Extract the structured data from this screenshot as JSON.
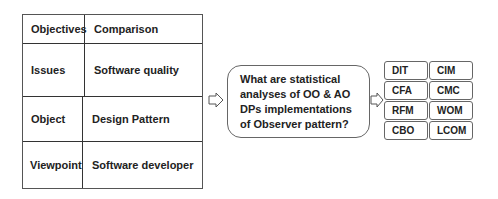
{
  "table": {
    "rows": [
      {
        "label": "Objectives",
        "value": "Comparison"
      },
      {
        "label": "Issues",
        "value": "Software quality"
      },
      {
        "label": "Object",
        "value": "Design Pattern"
      },
      {
        "label": "Viewpoint",
        "value": "Software developer"
      }
    ]
  },
  "question": "What are statistical analyses of OO & AO DPs implementations of Observer pattern?",
  "metrics": [
    [
      "DIT",
      "CIM"
    ],
    [
      "CFA",
      "CMC"
    ],
    [
      "RFM",
      "WOM"
    ],
    [
      "CBO",
      "LCOM"
    ]
  ]
}
